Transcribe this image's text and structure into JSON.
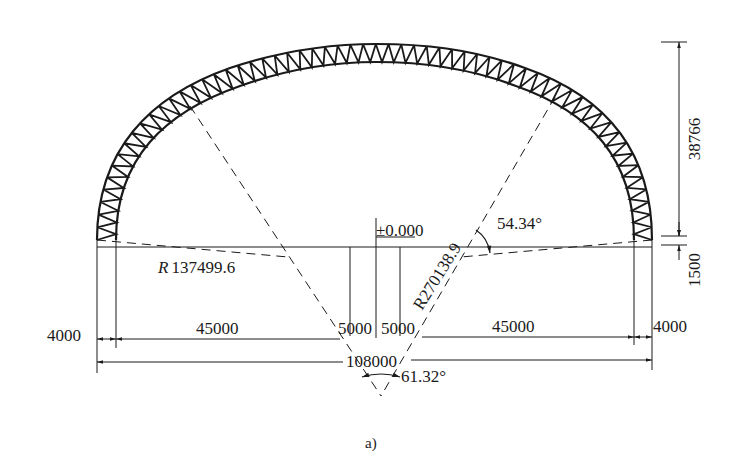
{
  "figure": {
    "caption": "a)",
    "type": "arched space truss cross-section (three-center arch)",
    "colors": {
      "ink": "#1a1a1a",
      "background": "#ffffff"
    }
  },
  "labels": {
    "height_rise": "38766",
    "height_base": "1500",
    "elevation": "±0.000",
    "angle_side": "54.34°",
    "angle_center": "61.32°",
    "radius_side_prefix": "R",
    "radius_side_value": "137499.6",
    "radius_center": "R270138.9",
    "span_left_edge": "4000",
    "span_left": "45000",
    "span_mid_left": "5000",
    "span_mid_right": "5000",
    "span_right": "45000",
    "span_right_edge": "4000",
    "span_total": "108000"
  },
  "dimensions": {
    "total_span": 108000,
    "edge_offsets": [
      4000,
      4000
    ],
    "inner_spans": [
      45000,
      5000,
      5000,
      45000
    ],
    "rise": 38766,
    "support_height": 1500,
    "radius_center_arc": 270138.9,
    "radius_side_arc": 137499.6,
    "angle_side_deg": 54.34,
    "angle_center_deg": 61.32
  }
}
